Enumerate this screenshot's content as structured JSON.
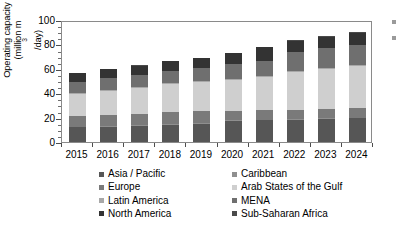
{
  "chart_data": {
    "type": "bar",
    "stacked": true,
    "title": "",
    "xlabel": "",
    "ylabel": "Operating capacity (million m³/day)",
    "ylabel_line1": "Operating capacity",
    "ylabel_line2_pre": "(million m",
    "ylabel_line2_sup": "3",
    "ylabel_line2_post": "/day)",
    "categories": [
      "2015",
      "2016",
      "2017",
      "2018",
      "2019",
      "2020",
      "2021",
      "2022",
      "2023",
      "2024"
    ],
    "ylim": [
      0,
      100
    ],
    "yticks": [
      0,
      20,
      40,
      60,
      80,
      100
    ],
    "ytick_labels": [
      "0",
      "20",
      "40",
      "60",
      "80",
      "100"
    ],
    "yminor_step": 5,
    "grid": false,
    "legend_position": "bottom",
    "legend_columns": 2,
    "series": [
      {
        "name": "Asia / Pacific",
        "color": "#565656",
        "values": [
          12.0,
          12.5,
          13.2,
          14.2,
          14.8,
          17.5,
          17.8,
          18.3,
          19.0,
          19.6
        ]
      },
      {
        "name": "Caribbean",
        "color": "#8f8f8f",
        "values": [
          0.4,
          0.4,
          0.4,
          0.4,
          0.4,
          0.4,
          0.4,
          0.4,
          0.4,
          0.4
        ]
      },
      {
        "name": "Europe",
        "color": "#7a7a7a",
        "values": [
          9.2,
          9.4,
          9.6,
          9.8,
          10.0,
          7.6,
          7.8,
          7.9,
          7.9,
          8.0
        ]
      },
      {
        "name": "Arab States of the Gulf",
        "color": "#cfcfcf",
        "values": [
          18.0,
          19.8,
          21.4,
          23.4,
          24.0,
          25.6,
          27.0,
          31.2,
          32.8,
          34.0
        ]
      },
      {
        "name": "Latin America",
        "color": "#a8a8a8",
        "values": [
          0.6,
          0.6,
          0.7,
          0.7,
          0.7,
          0.7,
          0.8,
          0.8,
          0.8,
          0.8
        ]
      },
      {
        "name": "MENA",
        "color": "#6f6f6f",
        "values": [
          9.4,
          9.6,
          9.8,
          10.0,
          11.2,
          12.4,
          13.0,
          15.0,
          16.2,
          16.8
        ]
      },
      {
        "name": "North America",
        "color": "#333333",
        "values": [
          7.0,
          7.4,
          7.6,
          7.8,
          7.6,
          8.6,
          10.8,
          9.4,
          9.4,
          10.0
        ]
      },
      {
        "name": "Sub-Saharan Africa",
        "color": "#4a4a4a",
        "values": [
          0.3,
          0.3,
          0.3,
          0.3,
          0.3,
          0.3,
          0.4,
          0.4,
          0.5,
          0.5
        ]
      }
    ],
    "totals": [
      56.9,
      60.0,
      63.0,
      66.6,
      69.0,
      73.1,
      78.0,
      83.4,
      87.0,
      90.1
    ]
  },
  "legend": {
    "rows": [
      {
        "left": {
          "label": "Asia / Pacific",
          "color": "#565656"
        },
        "right": {
          "label": "Caribbean",
          "color": "#8f8f8f"
        }
      },
      {
        "left": {
          "label": "Europe",
          "color": "#7a7a7a"
        },
        "right": {
          "label": "Arab States of the Gulf",
          "color": "#cfcfcf"
        }
      },
      {
        "left": {
          "label": "Latin America",
          "color": "#a8a8a8"
        },
        "right": {
          "label": "MENA",
          "color": "#6f6f6f"
        }
      },
      {
        "left": {
          "label": "North America",
          "color": "#333333"
        },
        "right": {
          "label": "Sub-Saharan Africa",
          "color": "#4a4a4a"
        }
      }
    ]
  },
  "style": {
    "axis_color": "#8a8a8a",
    "tick_color": "#4d4d4d",
    "text_color": "#000000",
    "background": "#ffffff"
  }
}
